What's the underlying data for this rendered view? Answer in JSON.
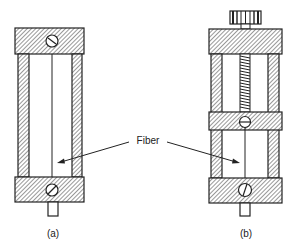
{
  "diagram": {
    "labels": {
      "fiber": "Fiber",
      "figure_a": "(a)",
      "figure_b": "(b)"
    },
    "colors": {
      "stroke": "#222222",
      "background": "#ffffff"
    },
    "figures": [
      {
        "id": "a",
        "caption": "(a)",
        "parts": [
          "top-block",
          "left-pillar",
          "right-pillar",
          "fiber",
          "bottom-block",
          "screw-top",
          "screw-bottom",
          "stub"
        ]
      },
      {
        "id": "b",
        "caption": "(b)",
        "parts": [
          "knurled-knob",
          "top-block",
          "threaded-rod",
          "left-pillar",
          "right-pillar",
          "middle-block",
          "fiber",
          "bottom-block",
          "screw-middle",
          "screw-bottom",
          "stub"
        ]
      }
    ]
  }
}
